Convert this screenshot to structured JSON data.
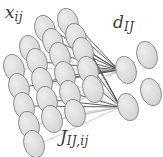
{
  "diagram": {
    "type": "neural-network-graph",
    "title": "",
    "labels": {
      "input_layer": "x",
      "input_layer_sub": "ij",
      "output_layer": "d",
      "output_layer_sub": "IJ",
      "weights": "J",
      "weights_sub": "IJ,ij"
    },
    "colors": {
      "node_fill": "#d9d9d9",
      "node_fill_light": "#e6e6e6",
      "node_stroke": "#8a8a8a",
      "edge_dark": "#545454",
      "edge_light": "#b8b8b8",
      "text": "#3a3a3a",
      "background": "#ffffff"
    },
    "node_geometry": {
      "rx": 10,
      "ry": 14,
      "rotation_deg": -18
    },
    "input_nodes": [
      {
        "id": "in-r0-c2",
        "cx": 45,
        "cy": 29
      },
      {
        "id": "in-r0-c3",
        "cx": 68,
        "cy": 22
      },
      {
        "id": "in-r1-c1",
        "cx": 30,
        "cy": 49
      },
      {
        "id": "in-r1-c2",
        "cx": 53,
        "cy": 42
      },
      {
        "id": "in-r1-c3",
        "cx": 76,
        "cy": 37
      },
      {
        "id": "in-r2-c0",
        "cx": 14,
        "cy": 68
      },
      {
        "id": "in-r2-c1",
        "cx": 37,
        "cy": 62
      },
      {
        "id": "in-r2-c2",
        "cx": 60,
        "cy": 56
      },
      {
        "id": "in-r2-c3",
        "cx": 83,
        "cy": 51
      },
      {
        "id": "in-r3-c0",
        "cx": 19,
        "cy": 87
      },
      {
        "id": "in-r3-c1",
        "cx": 42,
        "cy": 81
      },
      {
        "id": "in-r3-c2",
        "cx": 65,
        "cy": 75
      },
      {
        "id": "in-r3-c3",
        "cx": 88,
        "cy": 70
      },
      {
        "id": "in-r4-c0",
        "cx": 24,
        "cy": 106
      },
      {
        "id": "in-r4-c1",
        "cx": 47,
        "cy": 100
      },
      {
        "id": "in-r4-c2",
        "cx": 70,
        "cy": 94
      },
      {
        "id": "in-r4-c3",
        "cx": 93,
        "cy": 89
      },
      {
        "id": "in-r5-c0",
        "cx": 29,
        "cy": 125
      },
      {
        "id": "in-r5-c1",
        "cx": 52,
        "cy": 119
      },
      {
        "id": "in-r5-c2",
        "cx": 75,
        "cy": 113
      },
      {
        "id": "in-r6-c0",
        "cx": 34,
        "cy": 144
      }
    ],
    "output_nodes": [
      {
        "id": "out-top-right",
        "cx": 147,
        "cy": 55
      },
      {
        "id": "out-top-left",
        "cx": 126,
        "cy": 70
      },
      {
        "id": "out-bottom-right",
        "cx": 151,
        "cy": 92
      },
      {
        "id": "out-bottom-left",
        "cx": 128,
        "cy": 107
      }
    ],
    "edge_count": 30,
    "edges": [
      {
        "from": "in-r0-c3",
        "to": "out-top-left",
        "weight": "dark"
      },
      {
        "from": "in-r0-c3",
        "to": "out-bottom-left",
        "weight": "dark"
      },
      {
        "from": "in-r1-c2",
        "to": "out-top-left",
        "weight": "dark"
      },
      {
        "from": "in-r1-c3",
        "to": "out-top-left",
        "weight": "dark"
      },
      {
        "from": "in-r1-c3",
        "to": "out-bottom-left",
        "weight": "dark"
      },
      {
        "from": "in-r2-c1",
        "to": "out-top-left",
        "weight": "dark"
      },
      {
        "from": "in-r2-c2",
        "to": "out-top-left",
        "weight": "dark"
      },
      {
        "from": "in-r2-c3",
        "to": "out-top-left",
        "weight": "dark"
      },
      {
        "from": "in-r2-c3",
        "to": "out-bottom-left",
        "weight": "dark"
      },
      {
        "from": "in-r3-c0",
        "to": "out-top-left",
        "weight": "dark"
      },
      {
        "from": "in-r3-c1",
        "to": "out-top-left",
        "weight": "dark"
      },
      {
        "from": "in-r3-c2",
        "to": "out-top-left",
        "weight": "dark"
      },
      {
        "from": "in-r3-c3",
        "to": "out-top-left",
        "weight": "dark"
      },
      {
        "from": "in-r3-c3",
        "to": "out-bottom-left",
        "weight": "dark"
      },
      {
        "from": "in-r4-c0",
        "to": "out-bottom-left",
        "weight": "dark"
      },
      {
        "from": "in-r4-c1",
        "to": "out-bottom-left",
        "weight": "dark"
      },
      {
        "from": "in-r4-c2",
        "to": "out-bottom-left",
        "weight": "dark"
      },
      {
        "from": "in-r4-c3",
        "to": "out-bottom-left",
        "weight": "dark"
      },
      {
        "from": "in-r5-c0",
        "to": "out-bottom-left",
        "weight": "light"
      },
      {
        "from": "in-r5-c1",
        "to": "out-bottom-left",
        "weight": "light"
      },
      {
        "from": "in-r5-c2",
        "to": "out-bottom-left",
        "weight": "light"
      },
      {
        "from": "in-r6-c0",
        "to": "out-bottom-left",
        "weight": "light"
      },
      {
        "from": "in-r1-c2",
        "to": "out-bottom-left",
        "weight": "light"
      },
      {
        "from": "in-r2-c2",
        "to": "out-bottom-left",
        "weight": "light"
      },
      {
        "from": "in-r0-c2",
        "to": "out-top-left",
        "weight": "dark"
      },
      {
        "from": "in-r4-c1",
        "to": "out-top-left",
        "weight": "light"
      },
      {
        "from": "in-r5-c1",
        "to": "out-top-left",
        "weight": "light"
      },
      {
        "from": "in-r2-c0",
        "to": "out-top-left",
        "weight": "light"
      },
      {
        "from": "in-r4-c2",
        "to": "out-top-left",
        "weight": "light"
      },
      {
        "from": "in-r3-c1",
        "to": "out-bottom-left",
        "weight": "light"
      }
    ]
  }
}
